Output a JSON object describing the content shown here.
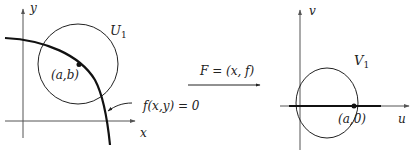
{
  "left_panel": {
    "x_axis_label": "x",
    "y_axis_label": "y",
    "set_label": "U",
    "set_subscript": "1",
    "point_label": "(a,b)",
    "curve_label": "f(x,y) = 0"
  },
  "map": {
    "label": "F = (x, f)"
  },
  "right_panel": {
    "u_axis_label": "u",
    "v_axis_label": "v",
    "set_label": "V",
    "set_subscript": "1",
    "point_label": "(a,0)"
  },
  "colors": {
    "stroke": "#222222",
    "axis": "#555555",
    "background": "#ffffff"
  }
}
